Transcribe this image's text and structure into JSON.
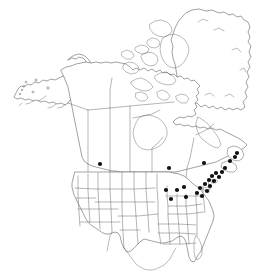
{
  "map": {
    "title": "North America species distribution map",
    "region_label": "North America",
    "background_color": "#ffffff",
    "outline_color": "#555555",
    "border_color": "#6b6b6b",
    "dot_color": "#101010",
    "dot_radius": 2.1,
    "width": 272,
    "height": 275,
    "regions": [
      {
        "name": "alaska",
        "label": "Alaska"
      },
      {
        "name": "canada",
        "label": "Canada"
      },
      {
        "name": "greenland",
        "label": "Greenland"
      },
      {
        "name": "united-states",
        "label": "United States"
      },
      {
        "name": "mexico",
        "label": "Mexico"
      }
    ]
  },
  "chart_data": {
    "type": "scatter",
    "xlabel": "",
    "ylabel": "",
    "xlim": [
      0,
      272
    ],
    "ylim": [
      0,
      275
    ],
    "grid": false,
    "legend": "none",
    "units": "pixel coordinates of plotted occurrence records",
    "series": [
      {
        "name": "occurrence-records",
        "marker": "filled-circle",
        "color": "#101010",
        "count": 24,
        "points": [
          {
            "x": 100,
            "y": 164,
            "region": "Montana"
          },
          {
            "x": 169,
            "y": 168,
            "region": "Ontario"
          },
          {
            "x": 204,
            "y": 163,
            "region": "Quebec"
          },
          {
            "x": 166,
            "y": 190,
            "region": "Wisconsin"
          },
          {
            "x": 177,
            "y": 190,
            "region": "Michigan"
          },
          {
            "x": 184,
            "y": 187,
            "region": "Michigan-east"
          },
          {
            "x": 171,
            "y": 199,
            "region": "Illinois-Indiana"
          },
          {
            "x": 186,
            "y": 197,
            "region": "Ohio"
          },
          {
            "x": 197,
            "y": 193,
            "region": "Pennsylvania-north"
          },
          {
            "x": 200,
            "y": 188,
            "region": "New-York-west"
          },
          {
            "x": 205,
            "y": 184,
            "region": "New-York-central"
          },
          {
            "x": 209,
            "y": 180,
            "region": "New-York-east"
          },
          {
            "x": 212,
            "y": 176,
            "region": "Vermont"
          },
          {
            "x": 216,
            "y": 173,
            "region": "New-Hampshire"
          },
          {
            "x": 219,
            "y": 177,
            "region": "Maine-south"
          },
          {
            "x": 222,
            "y": 172,
            "region": "Maine-central"
          },
          {
            "x": 225,
            "y": 168,
            "region": "Maine-north"
          },
          {
            "x": 214,
            "y": 181,
            "region": "Massachusetts"
          },
          {
            "x": 210,
            "y": 186,
            "region": "Connecticut"
          },
          {
            "x": 207,
            "y": 191,
            "region": "New-Jersey"
          },
          {
            "x": 202,
            "y": 196,
            "region": "Maryland"
          },
          {
            "x": 230,
            "y": 161,
            "region": "New-Brunswick"
          },
          {
            "x": 235,
            "y": 157,
            "region": "Nova-Scotia"
          },
          {
            "x": 237,
            "y": 153,
            "region": "Cape-Breton"
          }
        ]
      }
    ]
  }
}
